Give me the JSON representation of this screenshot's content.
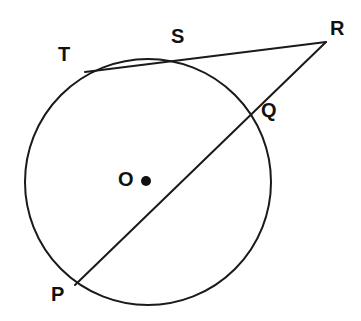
{
  "figure": {
    "background_color": "#ffffff",
    "stroke_color": "#1a1a1a",
    "label_color": "#111111",
    "width": 361,
    "height": 321
  },
  "circle": {
    "name": "circle-o",
    "center_x": 148,
    "center_y": 182,
    "radius": 123,
    "stroke_width": 2.0
  },
  "center_marker": {
    "name": "center-point-dot",
    "x": 146,
    "y": 181,
    "radius": 5
  },
  "points": [
    {
      "id": "T",
      "label": "T",
      "x": 85,
      "y": 72,
      "label_x": 58,
      "label_y": 44
    },
    {
      "id": "S",
      "label": "S",
      "x": 180,
      "y": 60,
      "label_x": 171,
      "label_y": 26
    },
    {
      "id": "R",
      "label": "R",
      "x": 326,
      "y": 42,
      "label_x": 330,
      "label_y": 18
    },
    {
      "id": "Q",
      "label": "Q",
      "x": 252,
      "y": 112,
      "label_x": 261,
      "label_y": 100
    },
    {
      "id": "P",
      "label": "P",
      "x": 75,
      "y": 285,
      "label_x": 51,
      "label_y": 284
    },
    {
      "id": "O",
      "label": "O",
      "x": 146,
      "y": 181,
      "label_x": 118,
      "label_y": 169
    }
  ],
  "segments": [
    {
      "id": "secant-TR",
      "from": "T",
      "to": "R",
      "x1": 85,
      "y1": 72,
      "x2": 326,
      "y2": 42,
      "stroke_width": 2.0
    },
    {
      "id": "secant-PR",
      "from": "P",
      "to": "R",
      "x1": 75,
      "y1": 285,
      "x2": 326,
      "y2": 42,
      "stroke_width": 2.0
    }
  ],
  "chart_data": {
    "type": "diagram",
    "shapes": [
      {
        "kind": "circle",
        "label": "O",
        "center": [
          148,
          182
        ],
        "radius": 123
      },
      {
        "kind": "point",
        "label": "O",
        "position": [
          146,
          181
        ],
        "role": "center"
      },
      {
        "kind": "point",
        "label": "T",
        "position": [
          85,
          72
        ],
        "role": "on-circle"
      },
      {
        "kind": "point",
        "label": "S",
        "position": [
          180,
          60
        ],
        "role": "on-circle"
      },
      {
        "kind": "point",
        "label": "Q",
        "position": [
          252,
          112
        ],
        "role": "on-circle"
      },
      {
        "kind": "point",
        "label": "P",
        "position": [
          75,
          285
        ],
        "role": "on-circle"
      },
      {
        "kind": "point",
        "label": "R",
        "position": [
          326,
          42
        ],
        "role": "external"
      },
      {
        "kind": "segment",
        "label": "TR",
        "endpoints": [
          [
            85,
            72
          ],
          [
            326,
            42
          ]
        ],
        "note": "secant through T and S"
      },
      {
        "kind": "segment",
        "label": "PR",
        "endpoints": [
          [
            75,
            285
          ],
          [
            326,
            42
          ]
        ],
        "note": "secant through P and Q"
      }
    ],
    "legend": [],
    "xlabel": "",
    "ylabel": ""
  }
}
